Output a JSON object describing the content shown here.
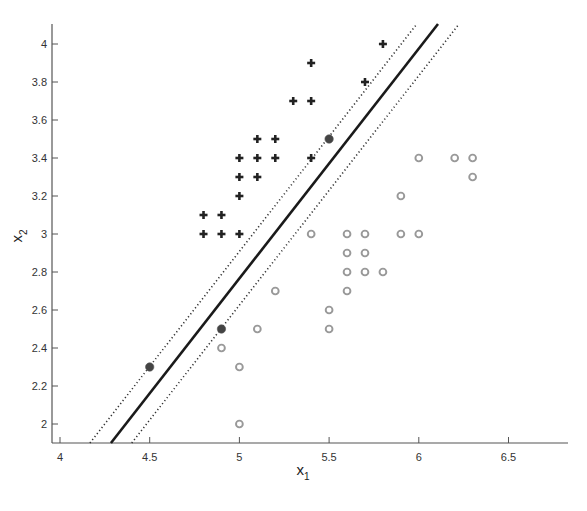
{
  "chart_data": {
    "type": "scatter",
    "title": "",
    "xlabel": "x",
    "xlabel_subscript": "1",
    "ylabel": "x",
    "ylabel_subscript": "2",
    "xlim": [
      3.95,
      6.83
    ],
    "ylim": [
      1.9,
      4.1
    ],
    "grid": false,
    "legend": null,
    "x_ticks": [
      4,
      4.5,
      5,
      5.5,
      6,
      6.5
    ],
    "x_tick_labels": [
      "4",
      "4.5",
      "5",
      "5.5",
      "6",
      "6.5"
    ],
    "y_ticks": [
      2,
      2.2,
      2.4,
      2.6,
      2.8,
      3,
      3.2,
      3.4,
      3.6,
      3.8,
      4
    ],
    "y_tick_labels": [
      "2",
      "2.2",
      "2.4",
      "2.6",
      "2.8",
      "3",
      "3.2",
      "3.4",
      "3.6",
      "3.8",
      "4"
    ],
    "series": [
      {
        "name": "class +1",
        "marker": "plus",
        "color": "#222222",
        "points": [
          [
            4.8,
            3.1
          ],
          [
            4.9,
            3.1
          ],
          [
            4.8,
            3.0
          ],
          [
            4.9,
            3.0
          ],
          [
            5.0,
            3.0
          ],
          [
            5.0,
            3.2
          ],
          [
            5.0,
            3.3
          ],
          [
            5.1,
            3.3
          ],
          [
            5.0,
            3.4
          ],
          [
            5.1,
            3.4
          ],
          [
            5.2,
            3.4
          ],
          [
            5.1,
            3.5
          ],
          [
            5.2,
            3.5
          ],
          [
            5.4,
            3.4
          ],
          [
            5.3,
            3.7
          ],
          [
            5.4,
            3.7
          ],
          [
            5.4,
            3.9
          ],
          [
            5.7,
            3.8
          ],
          [
            5.8,
            4.0
          ]
        ]
      },
      {
        "name": "class -1",
        "marker": "circle-open",
        "color": "#999999",
        "points": [
          [
            5.4,
            3.0
          ],
          [
            5.6,
            3.0
          ],
          [
            5.7,
            3.0
          ],
          [
            5.9,
            3.0
          ],
          [
            6.0,
            3.0
          ],
          [
            5.6,
            2.9
          ],
          [
            5.7,
            2.9
          ],
          [
            5.6,
            2.8
          ],
          [
            5.7,
            2.8
          ],
          [
            5.8,
            2.8
          ],
          [
            5.6,
            2.7
          ],
          [
            5.5,
            2.6
          ],
          [
            5.5,
            2.5
          ],
          [
            5.2,
            2.7
          ],
          [
            5.1,
            2.5
          ],
          [
            4.9,
            2.4
          ],
          [
            5.0,
            2.3
          ],
          [
            5.0,
            2.0
          ],
          [
            5.9,
            3.2
          ],
          [
            6.0,
            3.4
          ],
          [
            6.2,
            3.4
          ],
          [
            6.3,
            3.4
          ],
          [
            6.3,
            3.3
          ]
        ]
      },
      {
        "name": "support vectors",
        "marker": "circle-filled",
        "color": "#444444",
        "points": [
          [
            5.5,
            3.5
          ],
          [
            4.9,
            2.5
          ],
          [
            4.5,
            2.3
          ]
        ]
      }
    ],
    "lines": [
      {
        "name": "decision boundary",
        "style": "solid",
        "color": "#1a1a1a",
        "from": [
          4.284,
          1.9
        ],
        "to": [
          6.107,
          4.105
        ]
      },
      {
        "name": "margin upper",
        "style": "dotted",
        "color": "#333333",
        "from": [
          4.167,
          1.9
        ],
        "to": [
          5.985,
          4.1
        ]
      },
      {
        "name": "margin lower",
        "style": "dotted",
        "color": "#333333",
        "from": [
          4.4,
          1.9
        ],
        "to": [
          6.22,
          4.1
        ]
      }
    ]
  }
}
